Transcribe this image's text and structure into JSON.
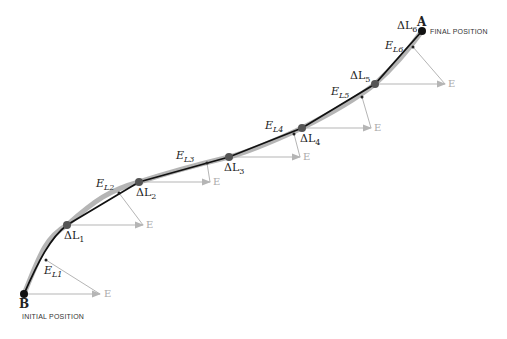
{
  "points": {
    "start": {
      "label": "B",
      "caption": "INITIAL POSITION"
    },
    "end": {
      "label": "A",
      "caption": "FINAL POSITION"
    }
  },
  "segments": [
    {
      "dl": "ΔL",
      "dl_sub": "1",
      "el": "E",
      "el_sub": "L1",
      "e": "E"
    },
    {
      "dl": "ΔL",
      "dl_sub": "2",
      "el": "E",
      "el_sub": "L2",
      "e": "E"
    },
    {
      "dl": "ΔL",
      "dl_sub": "3",
      "el": "E",
      "el_sub": "L3",
      "e": "E"
    },
    {
      "dl": "ΔL",
      "dl_sub": "4",
      "el": "E",
      "el_sub": "L4",
      "e": "E"
    },
    {
      "dl": "ΔL",
      "dl_sub": "5",
      "el": "E",
      "el_sub": "L5",
      "e": "E"
    },
    {
      "dl": "ΔL",
      "dl_sub": "6",
      "el": "E",
      "el_sub": "L6",
      "e": "E"
    }
  ],
  "colors": {
    "path": "#111111",
    "path_shadow": "#9a9a9a",
    "field_arrow": "#b0b0b0",
    "dot": "#444444"
  }
}
